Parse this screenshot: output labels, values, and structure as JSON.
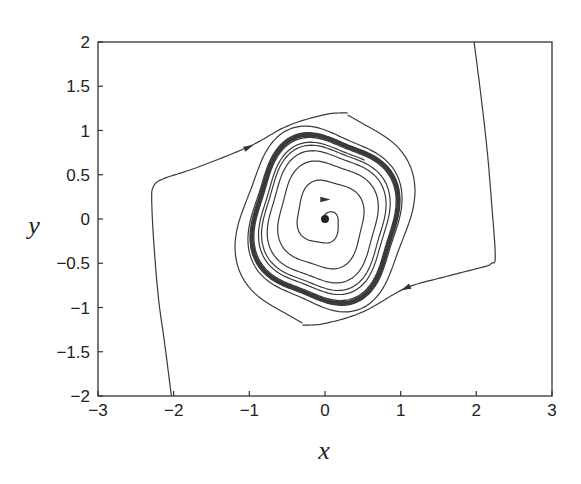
{
  "chart_data": {
    "type": "line",
    "title": "",
    "xlabel": "x",
    "ylabel": "y",
    "xlim": [
      -3,
      3
    ],
    "ylim": [
      -2,
      2
    ],
    "grid": false,
    "legend": null,
    "xticks": [
      -3,
      -2,
      -1,
      0,
      1,
      2,
      3
    ],
    "xtick_labels": [
      "−3",
      "−2",
      "−1",
      "0",
      "1",
      "2",
      "3"
    ],
    "yticks": [
      -2,
      -1.5,
      -1,
      -0.5,
      0,
      0.5,
      1,
      1.5,
      2
    ],
    "ytick_labels": [
      "−2",
      "−1.5",
      "−1",
      "−0.5",
      "0",
      "0.5",
      "1",
      "1.5",
      "2"
    ],
    "equilibrium": {
      "x": 0,
      "y": 0,
      "type": "unstable focus"
    },
    "limit_cycle": {
      "approx_x_extent": [
        -0.95,
        0.97
      ],
      "approx_y_extent": [
        -0.97,
        0.95
      ]
    },
    "series": [
      {
        "name": "outer-trajectory-left",
        "direction": "inward",
        "points": [
          [
            -2.03,
            -2.0
          ],
          [
            -2.12,
            -1.4
          ],
          [
            -2.2,
            -0.9
          ],
          [
            -2.26,
            -0.3
          ],
          [
            -2.29,
            0.2
          ],
          [
            -2.27,
            0.36
          ],
          [
            -2.15,
            0.45
          ],
          [
            -1.7,
            0.58
          ],
          [
            -1.0,
            0.82
          ],
          [
            -0.5,
            1.05
          ],
          [
            0.0,
            1.18
          ],
          [
            0.3,
            1.2
          ]
        ],
        "arrow_at": [
          -1.01,
          0.81
        ]
      },
      {
        "name": "outer-trajectory-right",
        "direction": "inward",
        "points": [
          [
            1.97,
            2.0
          ],
          [
            2.06,
            1.4
          ],
          [
            2.14,
            0.8
          ],
          [
            2.2,
            0.2
          ],
          [
            2.25,
            -0.42
          ],
          [
            2.2,
            -0.5
          ],
          [
            2.1,
            -0.54
          ],
          [
            1.6,
            -0.65
          ],
          [
            1.07,
            -0.78
          ],
          [
            0.5,
            -1.05
          ],
          [
            0.0,
            -1.18
          ],
          [
            -0.3,
            -1.2
          ]
        ],
        "arrow_at": [
          1.07,
          -0.78
        ]
      },
      {
        "name": "inner-spiral",
        "direction": "outward",
        "arrow_at": [
          0.0,
          0.22
        ]
      }
    ]
  },
  "axes": {
    "x_label": "x",
    "y_label": "y"
  }
}
